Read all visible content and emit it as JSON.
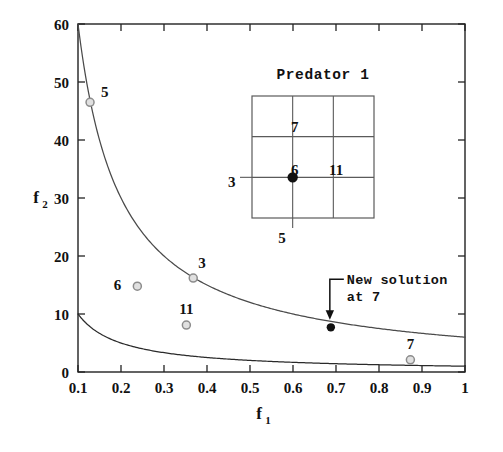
{
  "chart_data": {
    "type": "scatter",
    "title": "",
    "xlabel": "f_1",
    "ylabel": "f_2",
    "xlabel_base": "f",
    "xlabel_sub": "1",
    "ylabel_base": "f",
    "ylabel_sub": "2",
    "xlim": [
      0.1,
      1.0
    ],
    "ylim": [
      0,
      60
    ],
    "xticks": [
      0.1,
      0.2,
      0.3,
      0.4,
      0.5,
      0.6,
      0.7,
      0.8,
      0.9,
      1.0
    ],
    "xtick_labels": [
      "0.1",
      "0.2",
      "0.3",
      "0.4",
      "0.5",
      "0.6",
      "0.7",
      "0.8",
      "0.9",
      "1"
    ],
    "yticks": [
      0,
      10,
      20,
      30,
      40,
      50,
      60
    ],
    "ytick_labels": [
      "0",
      "10",
      "20",
      "30",
      "40",
      "50",
      "60"
    ],
    "grid": false,
    "legend": "none",
    "curves": [
      {
        "name": "upper-front",
        "formula": "f2 = 6 / f1",
        "constant": 6,
        "color": "#4a4a4a",
        "endpoints": [
          [
            0.1,
            60
          ],
          [
            1.0,
            6
          ]
        ]
      },
      {
        "name": "lower-front",
        "formula": "f2 = 1 / f1",
        "constant": 1,
        "color": "#2a2a2a",
        "endpoints": [
          [
            0.1,
            10
          ],
          [
            1.0,
            1
          ]
        ]
      }
    ],
    "series": [
      {
        "name": "solutions",
        "marker": "open-circle",
        "color": "#8c8c8c",
        "points": [
          {
            "label": "5",
            "x": 0.128,
            "y": 46.5,
            "label_dx": 11,
            "label_dy": -5
          },
          {
            "label": "3",
            "x": 0.368,
            "y": 16.2,
            "label_dx": 5,
            "label_dy": -10
          },
          {
            "label": "6",
            "x": 0.238,
            "y": 14.8,
            "label_dx": -16,
            "label_dy": 4
          },
          {
            "label": "11",
            "x": 0.352,
            "y": 8.1,
            "label_dx": 0,
            "label_dy": -11
          },
          {
            "label": "7",
            "x": 0.873,
            "y": 2.1,
            "label_dx": 0,
            "label_dy": -11
          }
        ]
      },
      {
        "name": "new-solution",
        "marker": "filled-circle",
        "color": "#111111",
        "points": [
          {
            "label": "",
            "x": 0.688,
            "y": 7.7
          }
        ]
      }
    ],
    "annotations": [
      {
        "name": "new-solution-annotation",
        "line1": "New solution",
        "line2": "at 7",
        "target_x": 0.688,
        "target_y": 7.7
      }
    ]
  },
  "inset": {
    "title": "Predator 1",
    "grid_cols": 3,
    "grid_rows": 3,
    "marker": "filled-circle",
    "marker_cell_x": 1,
    "marker_cell_y": 1,
    "labels": {
      "top_cell": "7",
      "center": "6",
      "right_cell": "11",
      "left_axis": "3",
      "bottom_axis": "5"
    }
  }
}
